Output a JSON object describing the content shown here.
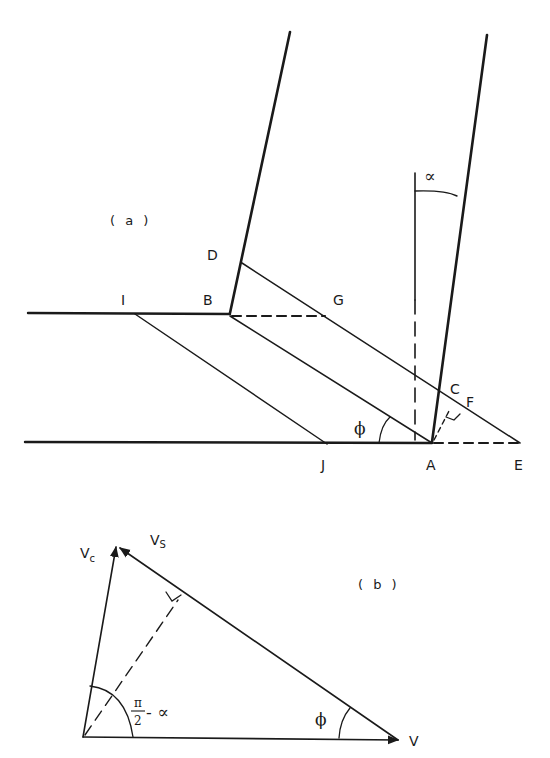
{
  "figure": {
    "ink_color": "#1a1a1a",
    "background": "#ffffff",
    "panel_a": {
      "label": "( a )",
      "points": {
        "A": "A",
        "B": "B",
        "C": "C",
        "D": "D",
        "E": "E",
        "F": "F",
        "G": "G",
        "I": "I",
        "J": "J"
      },
      "angles": {
        "alpha": "∝",
        "phi": "ϕ"
      }
    },
    "panel_b": {
      "label": "( b )",
      "vectors": {
        "Vc_main": "V",
        "Vc_sub": "c",
        "Vs_main": "V",
        "Vs_sub": "S",
        "V": "V"
      },
      "angles": {
        "pi_num": "π",
        "pi_den": "2",
        "minus_alpha": "- ∝",
        "phi": "ϕ"
      }
    }
  }
}
